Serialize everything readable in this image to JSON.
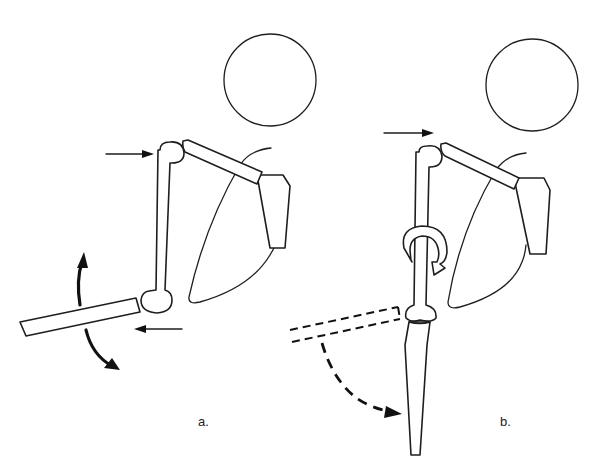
{
  "figure": {
    "panels": [
      {
        "id": "a",
        "label": "a.",
        "elements": [
          "head-circle",
          "clavicle",
          "scapula",
          "rib-cage-outline",
          "humerus-vertical",
          "forearm-horizontal",
          "push-arrow-right-at-shoulder",
          "push-arrow-left-at-elbow",
          "curved-arrow-up",
          "curved-arrow-down"
        ]
      },
      {
        "id": "b",
        "label": "b.",
        "elements": [
          "head-circle",
          "clavicle",
          "scapula",
          "rib-cage-outline",
          "humerus-vertical",
          "rotation-arrow-around-humerus",
          "forearm-hanging-down",
          "dashed-forearm-previous-position",
          "dashed-curved-arrow-down",
          "push-arrow-right-at-shoulder"
        ]
      }
    ],
    "colors": {
      "line": "#1e1e1e",
      "background": "#ffffff"
    }
  }
}
